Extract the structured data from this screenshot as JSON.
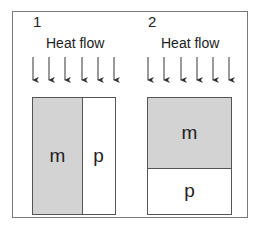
{
  "panels": [
    {
      "number": "1",
      "heat_label": "Heat flow",
      "arrow_count": 6,
      "layout": "side-by-side",
      "regions": [
        {
          "label": "m",
          "fill": "#d3d3d3"
        },
        {
          "label": "p",
          "fill": "#ffffff"
        }
      ]
    },
    {
      "number": "2",
      "heat_label": "Heat flow",
      "arrow_count": 6,
      "layout": "stacked",
      "regions": [
        {
          "label": "m",
          "fill": "#d3d3d3"
        },
        {
          "label": "p",
          "fill": "#ffffff"
        }
      ]
    }
  ],
  "colors": {
    "frame": "#7a7a7a",
    "box_border": "#555555",
    "m_fill": "#d3d3d3",
    "p_fill": "#ffffff",
    "arrow": "#333333"
  }
}
